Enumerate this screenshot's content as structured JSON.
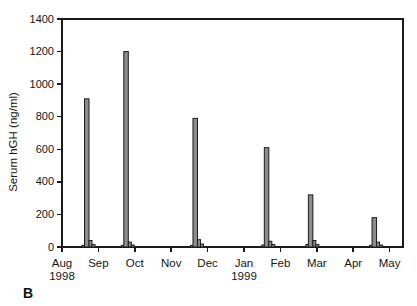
{
  "figure": {
    "panel_label": "B"
  },
  "chart_data": {
    "type": "bar",
    "title": "",
    "xlabel": "",
    "ylabel": "Serum hGH (ng/ml)",
    "ylim": [
      0,
      1400
    ],
    "ytick_step": 200,
    "grid": false,
    "legend": "none",
    "x_axis_note": "time axis, month index 0 = Aug 1998 through 9 = May 1999",
    "x_ticks": [
      {
        "label": "Aug",
        "year": "1998"
      },
      {
        "label": "Sep"
      },
      {
        "label": "Oct"
      },
      {
        "label": "Nov"
      },
      {
        "label": "Dec"
      },
      {
        "label": "Jan",
        "year": "1999"
      },
      {
        "label": "Feb"
      },
      {
        "label": "Mar"
      },
      {
        "label": "Apr"
      },
      {
        "label": "May"
      }
    ],
    "peak_values": [
      910,
      1200,
      790,
      610,
      320,
      180
    ],
    "clusters": [
      {
        "x_month": 0.68,
        "values": [
          10,
          910,
          40,
          15
        ]
      },
      {
        "x_month": 1.76,
        "values": [
          10,
          1200,
          30,
          12
        ]
      },
      {
        "x_month": 3.66,
        "values": [
          10,
          790,
          45,
          18
        ]
      },
      {
        "x_month": 5.62,
        "values": [
          12,
          610,
          35,
          15
        ]
      },
      {
        "x_month": 6.83,
        "values": [
          15,
          320,
          40,
          15
        ]
      },
      {
        "x_month": 8.58,
        "values": [
          10,
          180,
          30,
          12
        ]
      }
    ],
    "colors": {
      "bar_fill": "#8c8c8c",
      "bar_stroke": "#1c1c1c",
      "axis": "#1a1a1a",
      "text": "#151515"
    }
  }
}
